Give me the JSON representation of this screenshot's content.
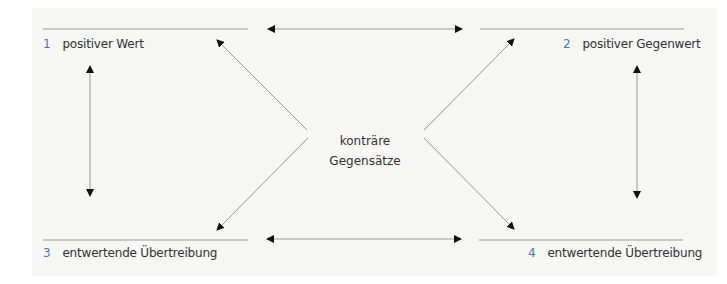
{
  "diagram": {
    "nodes": [
      {
        "number": "1",
        "label": "positiver Wert"
      },
      {
        "number": "2",
        "label": "positiver Gegenwert"
      },
      {
        "number": "3",
        "label": "entwertende Übertreibung"
      },
      {
        "number": "4",
        "label": "entwertende Übertreibung"
      }
    ],
    "center": {
      "line1": "konträre",
      "line2": "Gegensätze"
    },
    "colors": {
      "number": "#4a7aa8",
      "text": "#333333",
      "line": "#999999",
      "arrowhead": "#111111",
      "background": "#f6f6f5"
    }
  }
}
